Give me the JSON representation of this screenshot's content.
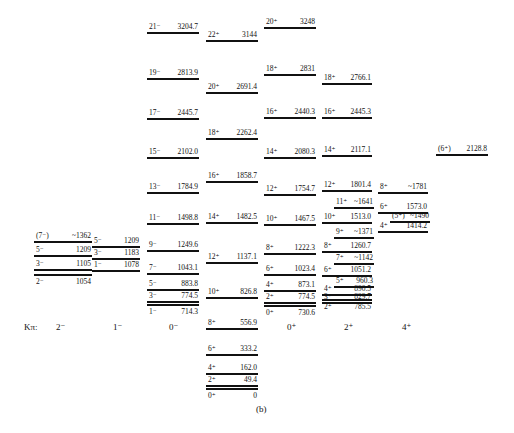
{
  "figure": {
    "caption": "(b)",
    "k_axis_label": "Kπ:",
    "k_bands": [
      "2⁻",
      "1⁻",
      "0⁻",
      "0⁺",
      "2⁺",
      "4⁺"
    ]
  },
  "bands": [
    {
      "name": "K2minus",
      "levels": [
        {
          "spin": "(7⁻)",
          "energy": "~1362"
        },
        {
          "spin": "5⁻",
          "energy": "1209"
        },
        {
          "spin": "3⁻",
          "energy": "1105"
        },
        {
          "spin": "2⁻",
          "energy": "1054"
        }
      ]
    },
    {
      "name": "K1minus",
      "levels": [
        {
          "spin": "5⁻",
          "energy": "1209"
        },
        {
          "spin": "3⁻",
          "energy": "1183"
        },
        {
          "spin": "1⁻",
          "energy": "1078"
        }
      ]
    },
    {
      "name": "K0minus",
      "levels": [
        {
          "spin": "21⁻",
          "energy": "3204.7"
        },
        {
          "spin": "19⁻",
          "energy": "2813.9"
        },
        {
          "spin": "17⁻",
          "energy": "2445.7"
        },
        {
          "spin": "15⁻",
          "energy": "2102.0"
        },
        {
          "spin": "13⁻",
          "energy": "1784.9"
        },
        {
          "spin": "11⁻",
          "energy": "1498.8"
        },
        {
          "spin": "9⁻",
          "energy": "1249.6"
        },
        {
          "spin": "7⁻",
          "energy": "1043.1"
        },
        {
          "spin": "5⁻",
          "energy": "883.8"
        },
        {
          "spin": "3⁻",
          "energy": "774.5"
        },
        {
          "spin": "1⁻",
          "energy": "714.3"
        }
      ]
    },
    {
      "name": "ground",
      "levels": [
        {
          "spin": "22⁺",
          "energy": "3144"
        },
        {
          "spin": "20⁺",
          "energy": "2691.4"
        },
        {
          "spin": "18⁺",
          "energy": "2262.4"
        },
        {
          "spin": "16⁺",
          "energy": "1858.7"
        },
        {
          "spin": "14⁺",
          "energy": "1482.5"
        },
        {
          "spin": "12⁺",
          "energy": "1137.1"
        },
        {
          "spin": "10⁺",
          "energy": "826.8"
        },
        {
          "spin": "8⁺",
          "energy": "556.9"
        },
        {
          "spin": "6⁺",
          "energy": "333.2"
        },
        {
          "spin": "4⁺",
          "energy": "162.0"
        },
        {
          "spin": "2⁺",
          "energy": "49.4"
        },
        {
          "spin": "0⁺",
          "energy": "0"
        }
      ]
    },
    {
      "name": "K0plus",
      "levels": [
        {
          "spin": "20⁺",
          "energy": "3248"
        },
        {
          "spin": "18⁺",
          "energy": "2831"
        },
        {
          "spin": "16⁺",
          "energy": "2440.3"
        },
        {
          "spin": "14⁺",
          "energy": "2080.3"
        },
        {
          "spin": "12⁺",
          "energy": "1754.7"
        },
        {
          "spin": "10⁺",
          "energy": "1467.5"
        },
        {
          "spin": "8⁺",
          "energy": "1222.3"
        },
        {
          "spin": "6⁺",
          "energy": "1023.4"
        },
        {
          "spin": "4⁺",
          "energy": "873.1"
        },
        {
          "spin": "2⁺",
          "energy": "774.5"
        },
        {
          "spin": "0⁺",
          "energy": "730.6"
        }
      ]
    },
    {
      "name": "K2plus",
      "levels": [
        {
          "spin": "18⁺",
          "energy": "2766.1"
        },
        {
          "spin": "16⁺",
          "energy": "2445.3"
        },
        {
          "spin": "14⁺",
          "energy": "2117.1"
        },
        {
          "spin": "12⁺",
          "energy": "1801.4"
        },
        {
          "spin": "11⁺",
          "energy": "~1641"
        },
        {
          "spin": "10⁺",
          "energy": "1513.0"
        },
        {
          "spin": "9⁺",
          "energy": "~1371"
        },
        {
          "spin": "8⁺",
          "energy": "1260.7"
        },
        {
          "spin": "7⁺",
          "energy": "~1142"
        },
        {
          "spin": "6⁺",
          "energy": "1051.2"
        },
        {
          "spin": "5⁺",
          "energy": "960.3"
        },
        {
          "spin": "4⁺",
          "energy": "890.5"
        },
        {
          "spin": "3⁺",
          "energy": "829.7"
        },
        {
          "spin": "2⁺",
          "energy": "785.5"
        }
      ]
    },
    {
      "name": "K4plus",
      "levels": [
        {
          "spin": "8⁺",
          "energy": "~1781"
        },
        {
          "spin": "6⁺",
          "energy": "1573.0"
        },
        {
          "spin": "(5⁺)",
          "energy": "~1490"
        },
        {
          "spin": "4⁺",
          "energy": "1414.2"
        }
      ]
    },
    {
      "name": "isolated",
      "levels": [
        {
          "spin": "(6⁺)",
          "energy": "2128.8"
        }
      ]
    }
  ]
}
